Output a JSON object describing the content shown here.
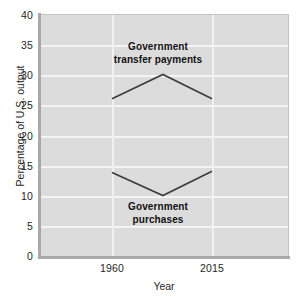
{
  "chart_data": {
    "type": "line",
    "title": "",
    "subtitle": "",
    "xlabel": "Year",
    "ylabel": "Percentage of U.S. output",
    "xlim": [
      1940,
      2040
    ],
    "ylim": [
      0,
      40
    ],
    "grid": true,
    "legend_position": "inline-annotation",
    "x_ticks": [
      "1960",
      "2015"
    ],
    "x_tick_values": [
      1960,
      2015
    ],
    "y_ticks": [
      "0",
      "5",
      "10",
      "15",
      "20",
      "25",
      "30",
      "35",
      "40"
    ],
    "y_tick_values": [
      0,
      5,
      10,
      15,
      20,
      25,
      30,
      35,
      40
    ],
    "x": [
      1960,
      1988,
      2015
    ],
    "series": [
      {
        "name": "Government transfer payments",
        "values": [
          26,
          30,
          26
        ],
        "annotation": "Government transfer payments",
        "color": "#3d3d3d"
      },
      {
        "name": "Government purchases",
        "values": [
          13.8,
          10,
          14
        ],
        "annotation": "Government purchases",
        "color": "#3d3d3d"
      }
    ],
    "colors": {
      "plot_background": "#dcdcdc",
      "gridline": "#f4f4f4",
      "axis_spine": "#a9a9a9",
      "line": "#3d3d3d",
      "text": "#262626",
      "annotation_text": "#111111",
      "figure_background": "#ffffff"
    }
  },
  "axes": {
    "y_title": "Percentage of U.S. output",
    "x_title": "Year",
    "y_tick_labels": [
      "40",
      "35",
      "30",
      "25",
      "20",
      "15",
      "10",
      "5",
      "0"
    ],
    "x_tick_labels": [
      "1960",
      "2015"
    ]
  },
  "annotations": {
    "transfer_line1": "Government",
    "transfer_line2": "transfer payments",
    "purchases_line1": "Government",
    "purchases_line2": "purchases"
  }
}
